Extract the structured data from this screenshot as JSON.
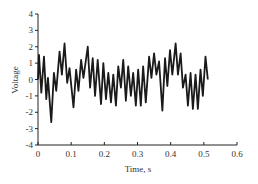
{
  "chart_data": {
    "type": "line",
    "title": "",
    "xlabel": "Time, s",
    "ylabel": "Voltage",
    "xlim": [
      0,
      0.6
    ],
    "ylim": [
      -4,
      4
    ],
    "grid": false,
    "legend": null,
    "x_ticks": [
      0,
      0.1,
      0.2,
      0.3,
      0.4,
      0.5,
      0.6
    ],
    "x_tick_labels": [
      "0",
      "0.1",
      "0.2",
      "0.3",
      "0.4",
      "0.5",
      "0.6"
    ],
    "y_ticks": [
      4,
      3,
      2,
      1,
      0,
      -1,
      -2,
      -3,
      -4
    ],
    "y_tick_labels": [
      "4",
      "3",
      "2",
      "1",
      "0",
      "-1",
      "-2",
      "-3",
      "-4"
    ],
    "series": [
      {
        "name": "Voltage signal",
        "color": "#1a1a1a",
        "x": [
          0.0,
          0.003,
          0.01,
          0.018,
          0.025,
          0.03,
          0.04,
          0.048,
          0.055,
          0.065,
          0.072,
          0.08,
          0.088,
          0.095,
          0.107,
          0.115,
          0.122,
          0.13,
          0.137,
          0.15,
          0.157,
          0.165,
          0.172,
          0.18,
          0.19,
          0.197,
          0.205,
          0.212,
          0.22,
          0.227,
          0.235,
          0.242,
          0.25,
          0.257,
          0.265,
          0.272,
          0.28,
          0.287,
          0.295,
          0.302,
          0.31,
          0.317,
          0.325,
          0.335,
          0.342,
          0.35,
          0.357,
          0.365,
          0.375,
          0.383,
          0.39,
          0.398,
          0.405,
          0.415,
          0.422,
          0.43,
          0.437,
          0.445,
          0.452,
          0.46,
          0.467,
          0.475,
          0.482,
          0.49,
          0.497,
          0.505,
          0.512
        ],
        "y": [
          0.0,
          1.5,
          -0.8,
          1.4,
          -1.2,
          0.1,
          -2.6,
          0.4,
          -0.7,
          1.7,
          0.3,
          2.2,
          -0.2,
          0.7,
          -1.7,
          0.6,
          -0.7,
          1.2,
          0.1,
          2.0,
          -0.5,
          1.3,
          -1.0,
          1.2,
          -1.5,
          1.0,
          -1.2,
          0.4,
          -1.4,
          0.3,
          -1.6,
          0.8,
          -0.5,
          1.2,
          -1.3,
          0.8,
          -1.0,
          0.4,
          -1.6,
          0.6,
          -1.6,
          0.8,
          -1.4,
          1.4,
          0.1,
          1.6,
          0.3,
          1.1,
          -1.9,
          1.3,
          -0.4,
          1.8,
          0.3,
          2.2,
          0.3,
          1.6,
          -0.5,
          0.3,
          -1.6,
          0.4,
          -1.8,
          0.3,
          -1.8,
          0.6,
          -1.0,
          1.4,
          0.0
        ]
      }
    ]
  }
}
